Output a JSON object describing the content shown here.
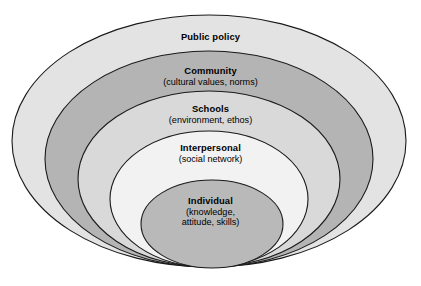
{
  "figure": {
    "name": "socio-ecological-model",
    "background_color": "#ffffff",
    "outline_color": "#1a1a1a"
  },
  "layers": [
    {
      "id": "public-policy",
      "title": "Public policy",
      "subtitle": "",
      "fill": "#e3e3e3",
      "level": 5
    },
    {
      "id": "community",
      "title": "Community",
      "subtitle": "(cultural values, norms)",
      "fill": "#b4b4b4",
      "level": 4
    },
    {
      "id": "schools",
      "title": "Schools",
      "subtitle": "(environment, ethos)",
      "fill": "#d9d9d9",
      "level": 3
    },
    {
      "id": "interpersonal",
      "title": "Interpersonal",
      "subtitle": "(social network)",
      "fill": "#f2f2f2",
      "level": 2
    },
    {
      "id": "individual",
      "title": "Individual",
      "subtitle_line1": "(knowledge,",
      "subtitle_line2": "attitude, skills)",
      "fill": "#b9b9b9",
      "level": 1
    }
  ]
}
